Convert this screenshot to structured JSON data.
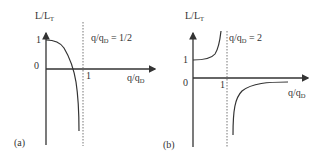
{
  "panels": [
    {
      "id": "a",
      "panel_label": "(a)",
      "y_axis_label": {
        "main": "L/L",
        "sub": "T"
      },
      "x_axis_label": {
        "main": "q/q",
        "sub": "D"
      },
      "y_ticks": [
        "1",
        "0"
      ],
      "x_ticks": [
        "1"
      ],
      "condition": {
        "main": "q/q",
        "sub": "D",
        "value": " = 1/2"
      },
      "curve_description": "Starts at L/L_T = 1 at q=0, decreases and crosses zero before q/q_D = 1, diverging to negative values near the dotted asymptote"
    },
    {
      "id": "b",
      "panel_label": "(b)",
      "y_axis_label": {
        "main": "L/L",
        "sub": "T"
      },
      "x_axis_label": {
        "main": "q/q",
        "sub": "D"
      },
      "y_ticks": [
        "1",
        "0"
      ],
      "x_ticks": [
        "1"
      ],
      "condition": {
        "main": "q/q",
        "sub": "D",
        "value": " = 2"
      },
      "curve_description": "Starts at L/L_T = 1, diverges to +infinity approaching q/q_D = 1; beyond q/q_D = 1 comes from -infinity and approaches 0 from below"
    }
  ],
  "colors": {
    "line": "#333333",
    "dotted": "#666666",
    "text": "#333333"
  }
}
